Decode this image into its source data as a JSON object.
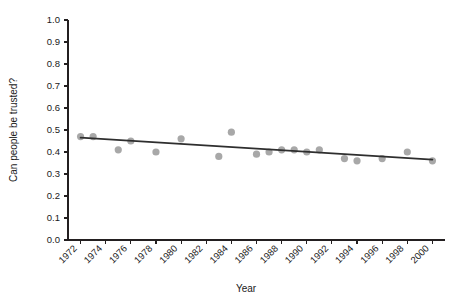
{
  "chart_data": {
    "type": "scatter",
    "title": "",
    "xlabel": "Year",
    "ylabel": "Can people be trusted?",
    "xlim": [
      1971,
      2001
    ],
    "ylim": [
      0.0,
      1.0
    ],
    "grid": false,
    "legend": null,
    "x_tick_labels": [
      "1972",
      "1974",
      "1976",
      "1978",
      "1980",
      "1982",
      "1984",
      "1986",
      "1988",
      "1990",
      "1992",
      "1994",
      "1996",
      "1998",
      "2000"
    ],
    "x_tick_values": [
      1972,
      1974,
      1976,
      1978,
      1980,
      1982,
      1984,
      1986,
      1988,
      1990,
      1992,
      1994,
      1996,
      1998,
      2000
    ],
    "y_tick_labels": [
      "0.0",
      "0.1",
      "0.2",
      "0.3",
      "0.4",
      "0.5",
      "0.6",
      "0.7",
      "0.8",
      "0.9",
      "1.0"
    ],
    "y_tick_values": [
      0.0,
      0.1,
      0.2,
      0.3,
      0.4,
      0.5,
      0.6,
      0.7,
      0.8,
      0.9,
      1.0
    ],
    "x": [
      1972,
      1973,
      1975,
      1976,
      1978,
      1980,
      1983,
      1984,
      1986,
      1987,
      1988,
      1989,
      1990,
      1991,
      1993,
      1994,
      1996,
      1998,
      2000
    ],
    "values": [
      0.47,
      0.47,
      0.41,
      0.45,
      0.4,
      0.46,
      0.38,
      0.49,
      0.39,
      0.4,
      0.41,
      0.41,
      0.4,
      0.41,
      0.37,
      0.36,
      0.37,
      0.4,
      0.36
    ],
    "series": [
      {
        "name": "Can people be trusted?",
        "marker": "circle",
        "color": "#a8a8a8",
        "points": [
          {
            "x": 1972,
            "y": 0.47
          },
          {
            "x": 1973,
            "y": 0.47
          },
          {
            "x": 1975,
            "y": 0.41
          },
          {
            "x": 1976,
            "y": 0.45
          },
          {
            "x": 1978,
            "y": 0.4
          },
          {
            "x": 1980,
            "y": 0.46
          },
          {
            "x": 1983,
            "y": 0.38
          },
          {
            "x": 1984,
            "y": 0.49
          },
          {
            "x": 1986,
            "y": 0.39
          },
          {
            "x": 1987,
            "y": 0.4
          },
          {
            "x": 1988,
            "y": 0.41
          },
          {
            "x": 1989,
            "y": 0.41
          },
          {
            "x": 1990,
            "y": 0.4
          },
          {
            "x": 1991,
            "y": 0.41
          },
          {
            "x": 1993,
            "y": 0.37
          },
          {
            "x": 1994,
            "y": 0.36
          },
          {
            "x": 1996,
            "y": 0.37
          },
          {
            "x": 1998,
            "y": 0.4
          },
          {
            "x": 2000,
            "y": 0.36
          }
        ]
      }
    ],
    "trend_line": {
      "name": "linear fit",
      "color": "#2e2e2e",
      "x_start": 1972,
      "y_start": 0.465,
      "x_end": 2000,
      "y_end": 0.365
    }
  },
  "axes": {
    "y_title": "Can people be trusted?",
    "x_title": "Year"
  }
}
